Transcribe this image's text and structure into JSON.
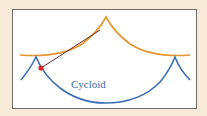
{
  "diagram": {
    "label": "Cycloid",
    "colors": {
      "background": "#f7ead9",
      "frame_border": "#6e6a66",
      "evolute_curve": "#e8942e",
      "cycloid_curve": "#3a6fb8",
      "tangent_line": "#6b2a1e",
      "point": "#d8262e"
    }
  }
}
